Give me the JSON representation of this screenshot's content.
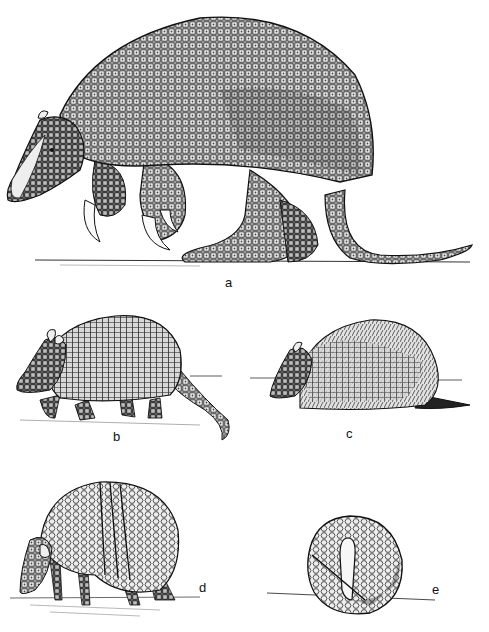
{
  "plate": {
    "description": "Scientific line-drawing plate of five armadillo illustrations",
    "panels": [
      {
        "id": "a",
        "label": "a",
        "subject": "giant armadillo walking"
      },
      {
        "id": "b",
        "label": "b",
        "subject": "nine-banded armadillo walking"
      },
      {
        "id": "c",
        "label": "c",
        "subject": "hairy armadillo"
      },
      {
        "id": "d",
        "label": "d",
        "subject": "three-banded armadillo partly curled"
      },
      {
        "id": "e",
        "label": "e",
        "subject": "three-banded armadillo rolled into ball"
      }
    ]
  },
  "colors": {
    "ink": "#1a1a1a",
    "paper": "#ffffff",
    "shade": "#7a7a7a"
  }
}
